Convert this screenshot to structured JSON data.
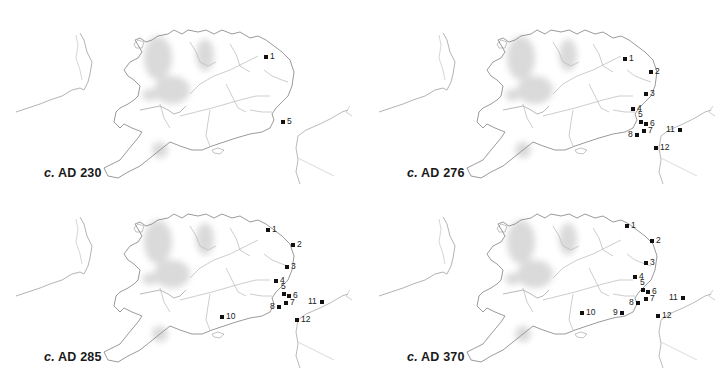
{
  "figure": {
    "type": "small-multiples map",
    "region": "Southern Britain and northern Gaul coast",
    "panels": [
      {
        "id": "p230",
        "caption_prefix": "c.",
        "caption_text": "AD 230",
        "origin": [
          0,
          0
        ],
        "sites": [
          {
            "n": "1",
            "x": 266,
            "y": 57,
            "label_side": "right"
          },
          {
            "n": "5",
            "x": 283,
            "y": 122,
            "label_side": "right"
          }
        ]
      },
      {
        "id": "p276",
        "caption_prefix": "c.",
        "caption_text": "AD 276",
        "origin": [
          363,
          0
        ],
        "sites": [
          {
            "n": "1",
            "x": 262,
            "y": 59,
            "label_side": "right"
          },
          {
            "n": "2",
            "x": 288,
            "y": 72,
            "label_side": "right"
          },
          {
            "n": "3",
            "x": 283,
            "y": 94,
            "label_side": "right"
          },
          {
            "n": "4",
            "x": 270,
            "y": 109,
            "label_side": "right"
          },
          {
            "n": "5",
            "x": 278,
            "y": 122,
            "label_side": "top"
          },
          {
            "n": "6",
            "x": 283,
            "y": 124,
            "label_side": "right"
          },
          {
            "n": "7",
            "x": 281,
            "y": 131,
            "label_side": "right"
          },
          {
            "n": "8",
            "x": 274,
            "y": 135,
            "label_side": "left"
          },
          {
            "n": "11",
            "x": 317,
            "y": 130,
            "label_side": "left"
          },
          {
            "n": "12",
            "x": 293,
            "y": 148,
            "label_side": "right"
          }
        ]
      },
      {
        "id": "p285",
        "caption_prefix": "c.",
        "caption_text": "AD 285",
        "origin": [
          0,
          184
        ],
        "sites": [
          {
            "n": "1",
            "x": 268,
            "y": 46,
            "label_side": "right"
          },
          {
            "n": "2",
            "x": 293,
            "y": 61,
            "label_side": "right"
          },
          {
            "n": "3",
            "x": 287,
            "y": 83,
            "label_side": "right"
          },
          {
            "n": "4",
            "x": 276,
            "y": 97,
            "label_side": "right"
          },
          {
            "n": "5",
            "x": 284,
            "y": 110,
            "label_side": "top"
          },
          {
            "n": "6",
            "x": 289,
            "y": 112,
            "label_side": "right"
          },
          {
            "n": "7",
            "x": 286,
            "y": 119,
            "label_side": "right"
          },
          {
            "n": "8",
            "x": 279,
            "y": 123,
            "label_side": "left"
          },
          {
            "n": "10",
            "x": 222,
            "y": 133,
            "label_side": "right"
          },
          {
            "n": "11",
            "x": 322,
            "y": 118,
            "label_side": "left"
          },
          {
            "n": "12",
            "x": 297,
            "y": 136,
            "label_side": "right"
          }
        ]
      },
      {
        "id": "p370",
        "caption_prefix": "c.",
        "caption_text": "AD 370",
        "origin": [
          363,
          184
        ],
        "sites": [
          {
            "n": "1",
            "x": 264,
            "y": 42,
            "label_side": "right"
          },
          {
            "n": "2",
            "x": 289,
            "y": 57,
            "label_side": "right"
          },
          {
            "n": "3",
            "x": 283,
            "y": 79,
            "label_side": "right"
          },
          {
            "n": "4",
            "x": 272,
            "y": 93,
            "label_side": "right"
          },
          {
            "n": "5",
            "x": 280,
            "y": 106,
            "label_side": "top"
          },
          {
            "n": "6",
            "x": 285,
            "y": 108,
            "label_side": "right"
          },
          {
            "n": "7",
            "x": 283,
            "y": 115,
            "label_side": "right"
          },
          {
            "n": "8",
            "x": 275,
            "y": 119,
            "label_side": "left"
          },
          {
            "n": "9",
            "x": 259,
            "y": 129,
            "label_side": "left"
          },
          {
            "n": "10",
            "x": 219,
            "y": 129,
            "label_side": "right"
          },
          {
            "n": "11",
            "x": 320,
            "y": 114,
            "label_side": "left"
          },
          {
            "n": "12",
            "x": 295,
            "y": 132,
            "label_side": "right"
          }
        ]
      }
    ],
    "colors": {
      "background": "#ffffff",
      "coast": "#9a9a9a",
      "river": "#b5b5b5",
      "relief": "#d8d8d8",
      "marker": "#111111",
      "text": "#1a1a1a"
    }
  }
}
